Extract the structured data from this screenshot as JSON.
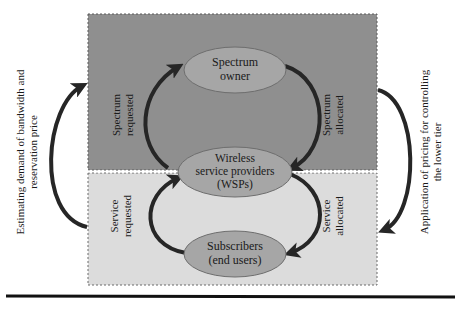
{
  "diagram": {
    "upper_tier": {
      "fill": "#8f8f8f",
      "node": {
        "line1": "Spectrum",
        "line2": "owner"
      },
      "left_arrow": {
        "line1": "Spectrum",
        "line2": "requested"
      },
      "right_arrow": {
        "line1": "Spectrum",
        "line2": "allocated"
      }
    },
    "middle_node": {
      "line1": "Wireless",
      "line2": "service providers",
      "line3": "(WSPs)"
    },
    "lower_tier": {
      "fill": "#dcdcdc",
      "node": {
        "line1": "Subscribers",
        "line2": "(end users)"
      },
      "left_arrow": {
        "line1": "Service",
        "line2": "requested"
      },
      "right_arrow": {
        "line1": "Service",
        "line2": "allocated"
      }
    },
    "outer_left": {
      "line1": "Estimating demand of bandwidth and",
      "line2": "reservation price"
    },
    "outer_right": {
      "line1": "Application of pricing for controlling",
      "line2": "the lower tier"
    },
    "colors": {
      "ellipse_fill": "#a6a6a6",
      "ellipse_stroke": "#6e6e6e",
      "arrow": "#262626",
      "rule": "#111111"
    }
  }
}
